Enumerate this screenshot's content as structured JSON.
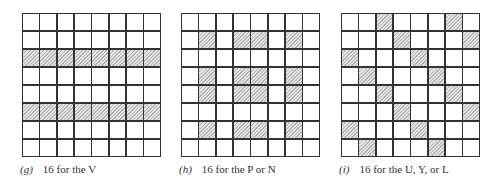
{
  "figure": {
    "panels": [
      {
        "id": "g",
        "tag": "(g)",
        "caption": "16 for the V",
        "rows": 8,
        "cols": 8,
        "shaded": [
          [
            0,
            0,
            0,
            0,
            0,
            0,
            0,
            0
          ],
          [
            0,
            0,
            0,
            0,
            0,
            0,
            0,
            0
          ],
          [
            1,
            1,
            1,
            1,
            1,
            1,
            1,
            1
          ],
          [
            0,
            0,
            0,
            0,
            0,
            0,
            0,
            0
          ],
          [
            0,
            0,
            0,
            0,
            0,
            0,
            0,
            0
          ],
          [
            1,
            1,
            1,
            1,
            1,
            1,
            1,
            1
          ],
          [
            0,
            0,
            0,
            0,
            0,
            0,
            0,
            0
          ],
          [
            0,
            0,
            0,
            0,
            0,
            0,
            0,
            0
          ]
        ]
      },
      {
        "id": "h",
        "tag": "(h)",
        "caption": "16 for the P or N",
        "rows": 8,
        "cols": 8,
        "shaded": [
          [
            0,
            0,
            0,
            0,
            0,
            0,
            0,
            0
          ],
          [
            0,
            1,
            0,
            1,
            1,
            0,
            1,
            0
          ],
          [
            0,
            0,
            0,
            0,
            0,
            0,
            0,
            0
          ],
          [
            0,
            1,
            0,
            1,
            1,
            0,
            1,
            0
          ],
          [
            0,
            1,
            0,
            1,
            1,
            0,
            1,
            0
          ],
          [
            0,
            0,
            0,
            0,
            0,
            0,
            0,
            0
          ],
          [
            0,
            1,
            0,
            1,
            1,
            0,
            1,
            0
          ],
          [
            0,
            0,
            0,
            0,
            0,
            0,
            0,
            0
          ]
        ]
      },
      {
        "id": "i",
        "tag": "(i)",
        "caption": "16 for the U, Y, or L",
        "rows": 8,
        "cols": 8,
        "shaded": [
          [
            0,
            0,
            1,
            0,
            0,
            0,
            1,
            0
          ],
          [
            0,
            0,
            0,
            1,
            0,
            0,
            0,
            1
          ],
          [
            1,
            0,
            0,
            0,
            1,
            0,
            0,
            0
          ],
          [
            0,
            1,
            0,
            0,
            0,
            1,
            0,
            0
          ],
          [
            0,
            0,
            1,
            0,
            0,
            0,
            1,
            0
          ],
          [
            0,
            0,
            0,
            1,
            0,
            0,
            0,
            1
          ],
          [
            1,
            0,
            0,
            0,
            1,
            0,
            0,
            0
          ],
          [
            0,
            1,
            0,
            0,
            0,
            1,
            0,
            0
          ]
        ]
      }
    ]
  }
}
